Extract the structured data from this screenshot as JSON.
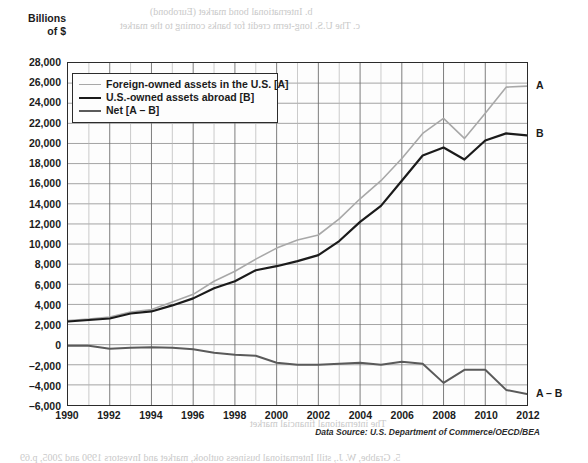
{
  "axis_title": "Billions\nof $",
  "axis_title_line1": "Billions",
  "axis_title_line2": "of $",
  "source_caption": "Data Source: U.S. Department of Commerce/OECD/BEA",
  "legend": {
    "items": [
      {
        "label": "Foreign-owned assets in the U.S. [A]",
        "color": "#a8a8a8",
        "key": "A"
      },
      {
        "label": "U.S.-owned assets abroad [B]",
        "color": "#1b1b1b",
        "key": "B"
      },
      {
        "label": "Net [A – B]",
        "color": "#5a5a5a",
        "key": "A-B"
      }
    ]
  },
  "end_labels": [
    {
      "text": "A",
      "value": 25700
    },
    {
      "text": "B",
      "value": 21000
    },
    {
      "text": "A – B",
      "value": -4700
    }
  ],
  "bleed_text": [
    {
      "text": "b.  International bond market (Eurobond)",
      "x": 150,
      "y": 6,
      "size": 10
    },
    {
      "text": "c.  The U.S. long-term credit for banks coming to the market",
      "x": 120,
      "y": 20,
      "size": 10
    },
    {
      "text": "Financial Market Instruments",
      "x": 300,
      "y": 62,
      "size": 11
    },
    {
      "text": "Global Capital Markets Flows",
      "x": 300,
      "y": 86,
      "size": 11
    },
    {
      "text": "The International Financial Markets",
      "x": 300,
      "y": 110,
      "size": 11
    },
    {
      "text": "Equities, bonds, and bank loans",
      "x": 320,
      "y": 132,
      "size": 10
    },
    {
      "text": "Net Capital Flows 1990–2012",
      "x": 330,
      "y": 152,
      "size": 10
    },
    {
      "text": "International Investment",
      "x": 300,
      "y": 196,
      "size": 10
    },
    {
      "text": "Balance of Payments",
      "x": 340,
      "y": 238,
      "size": 10
    },
    {
      "text": "U.S. Net International Investment Position",
      "x": 230,
      "y": 298,
      "size": 11
    },
    {
      "text": "Direct investment abroad",
      "x": 360,
      "y": 340,
      "size": 10
    },
    {
      "text": "The international financial market",
      "x": 250,
      "y": 418,
      "size": 10
    },
    {
      "text": "5.   Grabbe, W. J., still International business outlook, market and Investors 1990 and 2005, p.69",
      "x": 20,
      "y": 452,
      "size": 10
    }
  ],
  "chart_data": {
    "type": "line",
    "title": "",
    "xlabel": "",
    "ylabel": "Billions of $",
    "xlim": [
      1990,
      2012
    ],
    "ylim": [
      -6000,
      28000
    ],
    "ytick_step": 2000,
    "grid": true,
    "legend_position": "top-left",
    "yticks": [
      28000,
      26000,
      24000,
      22000,
      20000,
      18000,
      16000,
      14000,
      12000,
      10000,
      8000,
      6000,
      4000,
      2000,
      0,
      -2000,
      -4000,
      -6000
    ],
    "ytick_labels": [
      "28,000",
      "26,000",
      "24,000",
      "22,000",
      "20,000",
      "18,000",
      "16,000",
      "14,000",
      "12,000",
      "10,000",
      "8,000",
      "6,000",
      "4,000",
      "2,000",
      "0",
      "–2,000",
      "–4,000",
      "–6,000"
    ],
    "x": [
      1990,
      1991,
      1992,
      1993,
      1994,
      1995,
      1996,
      1997,
      1998,
      1999,
      2000,
      2001,
      2002,
      2003,
      2004,
      2005,
      2006,
      2007,
      2008,
      2009,
      2010,
      2011,
      2012
    ],
    "xtick_labels": [
      "1990",
      "1992",
      "1994",
      "1996",
      "1998",
      "2000",
      "2002",
      "2004",
      "2006",
      "2008",
      "2010",
      "2012"
    ],
    "xticks": [
      1990,
      1992,
      1994,
      1996,
      1998,
      2000,
      2002,
      2004,
      2006,
      2008,
      2010,
      2012
    ],
    "series": [
      {
        "name": "Foreign-owned assets in the U.S. [A]",
        "key": "A",
        "color": "#a8a8a8",
        "width": 1.6,
        "values": [
          2400,
          2550,
          2750,
          3250,
          3500,
          4250,
          5000,
          6300,
          7300,
          8500,
          9600,
          10400,
          10900,
          12500,
          14500,
          16300,
          18500,
          21000,
          22500,
          20500,
          23000,
          25600,
          25700
        ]
      },
      {
        "name": "U.S.-owned assets abroad [B]",
        "key": "B",
        "color": "#1b1b1b",
        "width": 2.2,
        "values": [
          2300,
          2450,
          2600,
          3100,
          3300,
          3900,
          4600,
          5600,
          6300,
          7400,
          7800,
          8300,
          8900,
          10300,
          12200,
          13800,
          16300,
          18800,
          19600,
          18400,
          20300,
          21000,
          20800
        ]
      },
      {
        "name": "Net [A – B]",
        "key": "A-B",
        "color": "#5a5a5a",
        "width": 2.0,
        "values": [
          -100,
          -100,
          -400,
          -300,
          -250,
          -300,
          -450,
          -800,
          -1000,
          -1100,
          -1800,
          -2000,
          -2000,
          -1900,
          -1800,
          -2000,
          -1700,
          -1900,
          -3800,
          -2500,
          -2500,
          -4500,
          -4900
        ]
      }
    ]
  }
}
